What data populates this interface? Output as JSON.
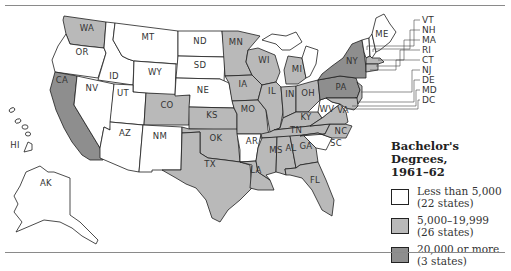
{
  "colors": {
    "low": "#ffffff",
    "mid": "#b9b9b9",
    "high": "#8e8e8e",
    "border": "#1e1e1e"
  },
  "legend": {
    "title_line1": "Bachelor's Degrees,",
    "title_line2": "1961–62",
    "items": [
      {
        "range": "Less than 5,000",
        "count": "(22 states)",
        "class": "low"
      },
      {
        "range": "5,000–19,999",
        "count": "(26 states)",
        "class": "mid"
      },
      {
        "range": "20,000 or more",
        "count": "(3 states)",
        "class": "high"
      }
    ]
  },
  "callouts": [
    "VT",
    "NH",
    "MA",
    "RI",
    "CT",
    "NJ",
    "DE",
    "MD",
    "DC"
  ],
  "states": {
    "WA": {
      "label": "WA",
      "class": "mid"
    },
    "OR": {
      "label": "OR",
      "class": "low"
    },
    "CA": {
      "label": "CA",
      "class": "high"
    },
    "ID": {
      "label": "ID",
      "class": "low"
    },
    "NV": {
      "label": "NV",
      "class": "low"
    },
    "MT": {
      "label": "MT",
      "class": "low"
    },
    "WY": {
      "label": "WY",
      "class": "low"
    },
    "UT": {
      "label": "UT",
      "class": "low"
    },
    "AZ": {
      "label": "AZ",
      "class": "low"
    },
    "CO": {
      "label": "CO",
      "class": "mid"
    },
    "NM": {
      "label": "NM",
      "class": "low"
    },
    "ND": {
      "label": "ND",
      "class": "low"
    },
    "SD": {
      "label": "SD",
      "class": "low"
    },
    "NE": {
      "label": "NE",
      "class": "low"
    },
    "KS": {
      "label": "KS",
      "class": "mid"
    },
    "OK": {
      "label": "OK",
      "class": "mid"
    },
    "TX": {
      "label": "TX",
      "class": "mid"
    },
    "MN": {
      "label": "MN",
      "class": "mid"
    },
    "IA": {
      "label": "IA",
      "class": "mid"
    },
    "MO": {
      "label": "MO",
      "class": "mid"
    },
    "AR": {
      "label": "AR",
      "class": "low"
    },
    "LA": {
      "label": "LA",
      "class": "mid"
    },
    "WI": {
      "label": "WI",
      "class": "mid"
    },
    "IL": {
      "label": "IL",
      "class": "mid"
    },
    "MI": {
      "label": "MI",
      "class": "mid"
    },
    "IN": {
      "label": "IN",
      "class": "mid"
    },
    "OH": {
      "label": "OH",
      "class": "mid"
    },
    "KY": {
      "label": "KY",
      "class": "mid"
    },
    "TN": {
      "label": "TN",
      "class": "mid"
    },
    "MS": {
      "label": "MS",
      "class": "mid"
    },
    "AL": {
      "label": "AL",
      "class": "mid"
    },
    "GA": {
      "label": "GA",
      "class": "mid"
    },
    "FL": {
      "label": "FL",
      "class": "mid"
    },
    "SC": {
      "label": "SC",
      "class": "low"
    },
    "NC": {
      "label": "NC",
      "class": "mid"
    },
    "VA": {
      "label": "VA",
      "class": "mid"
    },
    "WV": {
      "label": "WV",
      "class": "low"
    },
    "PA": {
      "label": "PA",
      "class": "high"
    },
    "NY": {
      "label": "NY",
      "class": "high"
    },
    "ME": {
      "label": "ME",
      "class": "low"
    },
    "AK": {
      "label": "AK",
      "class": "low"
    },
    "HI": {
      "label": "HI",
      "class": "low"
    }
  }
}
